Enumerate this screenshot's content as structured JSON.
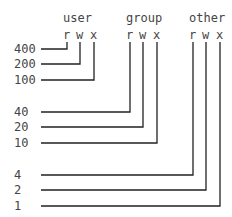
{
  "groups": [
    {
      "name": "user",
      "bits": [
        "r",
        "w",
        "x"
      ],
      "values": [
        "400",
        "200",
        "100"
      ]
    },
    {
      "name": "group",
      "bits": [
        "r",
        "w",
        "x"
      ],
      "values": [
        "40",
        "20",
        "10"
      ]
    },
    {
      "name": "other",
      "bits": [
        "r",
        "w",
        "x"
      ],
      "values": [
        "4",
        "2",
        "1"
      ]
    }
  ],
  "colors": {
    "line": "#222222",
    "text": "#444444"
  }
}
